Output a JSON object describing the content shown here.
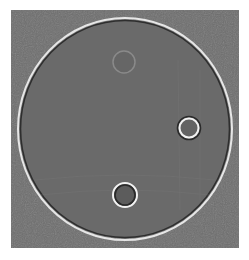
{
  "image": {
    "description": "Grayscale reconstruction of a circular phantom with three small circular inserts",
    "background_color": "#ffffff",
    "field_color": "#6e6e6e",
    "disc": {
      "cx": 125,
      "cy": 129,
      "rx": 107,
      "ry": 111,
      "rim_light": "#e6e6e6",
      "rim_dark": "#2e2e2e"
    },
    "inserts": [
      {
        "name": "top",
        "cx": 124,
        "cy": 62,
        "r": 11,
        "stroke": "#8a8a8a"
      },
      {
        "name": "right",
        "cx": 189,
        "cy": 128,
        "r": 10,
        "stroke": "#f2f2f2"
      },
      {
        "name": "bottom",
        "cx": 125,
        "cy": 195,
        "r": 12,
        "stroke": "#f2f2f2"
      }
    ]
  }
}
